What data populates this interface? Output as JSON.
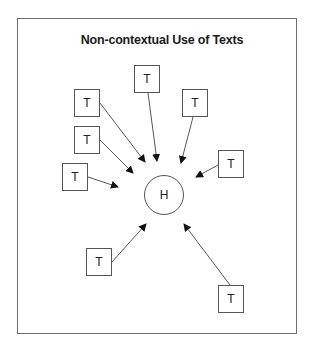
{
  "diagram": {
    "title": "Non-contextual Use of Texts",
    "center_node": {
      "label": "H"
    },
    "text_nodes": [
      {
        "label": "T",
        "position": "upper-left"
      },
      {
        "label": "T",
        "position": "top-center"
      },
      {
        "label": "T",
        "position": "upper-right"
      },
      {
        "label": "T",
        "position": "left-middle"
      },
      {
        "label": "T",
        "position": "left-lower"
      },
      {
        "label": "T",
        "position": "right"
      },
      {
        "label": "T",
        "position": "bottom-left"
      },
      {
        "label": "T",
        "position": "bottom-right"
      }
    ],
    "edges": [
      {
        "from": "upper-left",
        "to": "H"
      },
      {
        "from": "top-center",
        "to": "H"
      },
      {
        "from": "upper-right",
        "to": "H"
      },
      {
        "from": "left-middle",
        "to": "H"
      },
      {
        "from": "left-lower",
        "to": "H"
      },
      {
        "from": "right",
        "to": "H"
      },
      {
        "from": "bottom-left",
        "to": "H"
      },
      {
        "from": "bottom-right",
        "to": "H"
      }
    ],
    "colors": {
      "stroke": "#555555",
      "frame": "#6e6e6e",
      "text": "#1a1a1a",
      "background": "#ffffff"
    }
  }
}
